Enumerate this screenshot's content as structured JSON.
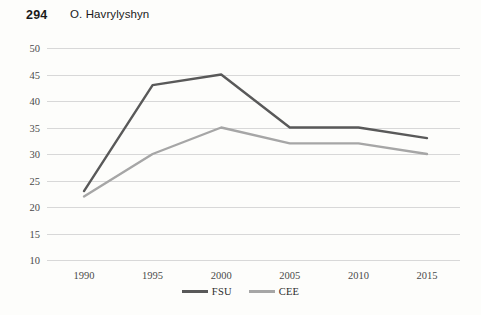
{
  "header": {
    "page_number": "294",
    "author": "O. Havrylyshyn"
  },
  "legend": {
    "position": "bottom-center",
    "entries": [
      {
        "label": "FSU",
        "color": "#595959"
      },
      {
        "label": "CEE",
        "color": "#a6a6a6"
      }
    ]
  },
  "chart_data": {
    "type": "line",
    "title": "",
    "subtitle": "",
    "xlabel": "",
    "ylabel": "",
    "categories": [
      "1990",
      "1995",
      "2000",
      "2005",
      "2010",
      "2015"
    ],
    "x": [
      1990,
      1995,
      2000,
      2005,
      2010,
      2015
    ],
    "series": [
      {
        "name": "FSU",
        "color": "#595959",
        "values": [
          23,
          43,
          45,
          35,
          35,
          33
        ]
      },
      {
        "name": "CEE",
        "color": "#a6a6a6",
        "values": [
          22,
          30,
          35,
          32,
          32,
          30
        ]
      }
    ],
    "ylim": [
      10,
      50
    ],
    "ytick_step": 5,
    "yticks": [
      "50",
      "45",
      "40",
      "35",
      "30",
      "25",
      "20",
      "15",
      "10"
    ],
    "xticks": [
      "1990",
      "1995",
      "2000",
      "2005",
      "2010",
      "2015"
    ],
    "grid": true,
    "grid_color": "#d8d8d8",
    "legend_position": "bottom-center"
  }
}
